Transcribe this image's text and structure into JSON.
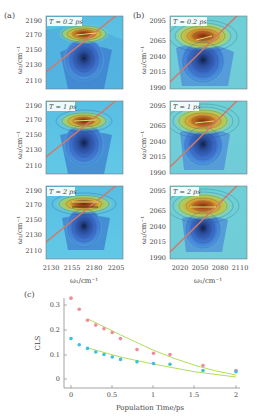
{
  "figure": {
    "panel_a": {
      "label": "(a)",
      "ylabel": "ω₃/cm⁻¹",
      "xlabel": "ω₁/cm⁻¹",
      "yticks": [
        "2190",
        "2170",
        "2150",
        "2130",
        "2110"
      ],
      "xticks": [
        "2130",
        "2155",
        "2180",
        "2205"
      ],
      "rows": [
        {
          "time_label": "T = 0.2 ps"
        },
        {
          "time_label": "T = 1 ps"
        },
        {
          "time_label": "T = 2 ps"
        }
      ]
    },
    "panel_b": {
      "label": "(b)",
      "ylabel": "ω₃/cm⁻¹",
      "xlabel": "ω₁/cm⁻¹",
      "yticks": [
        "2095",
        "2065",
        "2040",
        "2015",
        "1990"
      ],
      "xticks": [
        "2020",
        "2050",
        "2080",
        "2110"
      ],
      "rows": [
        {
          "time_label": "T = 0.2 ps"
        },
        {
          "time_label": "T = 1 ps"
        },
        {
          "time_label": "T = 2 ps"
        }
      ]
    },
    "panel_c": {
      "label": "(c)",
      "ylabel": "CLS",
      "xlabel": "Population Time/ps",
      "yticks": [
        "0",
        "0.1",
        "0.2",
        "0.3"
      ],
      "xticks": [
        "0",
        "0.5",
        "1",
        "1.5",
        "2"
      ]
    }
  },
  "colors": {
    "series_pink": "#f08a9a",
    "series_cyan": "#3cc0e0",
    "fit_line": "#a8d84a",
    "diagonal": "#d07a6a"
  },
  "chart_data": [
    {
      "type": "heatmap",
      "title": "(a) 2D IR spectra",
      "xlabel": "ω₁/cm⁻¹",
      "ylabel": "ω₃/cm⁻¹",
      "xlim": [
        2120,
        2210
      ],
      "ylim": [
        2100,
        2200
      ],
      "xticks": [
        2130,
        2155,
        2180,
        2205
      ],
      "yticks": [
        2110,
        2130,
        2150,
        2170,
        2190
      ],
      "subplots": [
        "T = 0.2 ps",
        "T = 1 ps",
        "T = 2 ps"
      ],
      "features": "positive (red/yellow) peak near ω₃≈2170, negative (blue) peak near ω₃≈2140; diagonal line"
    },
    {
      "type": "heatmap",
      "title": "(b) 2D IR spectra",
      "xlabel": "ω₁/cm⁻¹",
      "ylabel": "ω₃/cm⁻¹",
      "xlim": [
        2005,
        2120
      ],
      "ylim": [
        1985,
        2100
      ],
      "xticks": [
        2020,
        2050,
        2080,
        2110
      ],
      "yticks": [
        1990,
        2015,
        2040,
        2065,
        2095
      ],
      "subplots": [
        "T = 0.2 ps",
        "T = 1 ps",
        "T = 2 ps"
      ],
      "features": "positive (red/yellow) peak near ω₃≈2065, negative (blue) peak near ω₃≈2035; diagonal line"
    },
    {
      "type": "scatter",
      "title": "(c)",
      "xlabel": "Population Time/ps",
      "ylabel": "CLS",
      "xlim": [
        -0.1,
        2.05
      ],
      "ylim": [
        -0.02,
        0.34
      ],
      "xticks": [
        0,
        0.5,
        1,
        1.5,
        2
      ],
      "yticks": [
        0,
        0.1,
        0.2,
        0.3
      ],
      "grid": false,
      "series": [
        {
          "name": "pink",
          "color": "#f08a9a",
          "x": [
            0,
            0.1,
            0.2,
            0.3,
            0.4,
            0.5,
            0.6,
            0.8,
            1.0,
            1.2,
            1.6,
            2.0
          ],
          "values": [
            0.33,
            0.285,
            0.24,
            0.22,
            0.205,
            0.19,
            0.165,
            0.12,
            0.105,
            0.1,
            0.055,
            0.035
          ]
        },
        {
          "name": "cyan",
          "color": "#3cc0e0",
          "x": [
            0,
            0.1,
            0.2,
            0.3,
            0.4,
            0.5,
            0.6,
            0.8,
            1.0,
            1.2,
            1.6,
            2.0
          ],
          "values": [
            0.165,
            0.14,
            0.125,
            0.11,
            0.1,
            0.09,
            0.08,
            0.07,
            0.063,
            0.06,
            0.035,
            0.03
          ]
        },
        {
          "name": "pink-fit",
          "type": "line",
          "color": "#a8d84a",
          "x": [
            0.2,
            0.5,
            1.0,
            1.5,
            2.0
          ],
          "values": [
            0.245,
            0.19,
            0.12,
            0.075,
            0.045
          ]
        },
        {
          "name": "cyan-fit",
          "type": "line",
          "color": "#a8d84a",
          "x": [
            0.2,
            0.5,
            1.0,
            1.5,
            2.0
          ],
          "values": [
            0.125,
            0.095,
            0.065,
            0.045,
            0.032
          ]
        }
      ]
    }
  ]
}
